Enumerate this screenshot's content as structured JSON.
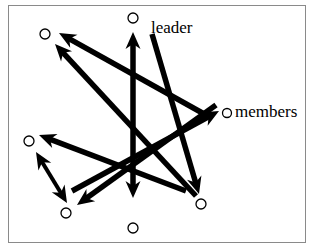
{
  "figure": {
    "type": "diagram",
    "kind": "node-link-graph",
    "background": "#ffffff",
    "frame": {
      "border_color": "#8a8a8a",
      "border_width": 1,
      "x": 8,
      "y": 5,
      "width": 298,
      "height": 238
    },
    "stroke_color": "#000000",
    "node_style": {
      "shape": "circle",
      "fill": "none",
      "stroke": "#000000",
      "stroke_width": 1.3,
      "radius": 5
    }
  },
  "labels": {
    "leader": "leader",
    "members": "members"
  },
  "nodes": [
    {
      "id": "n-top-center",
      "role": "leader",
      "cx": 133,
      "cy": 18,
      "r": 5
    },
    {
      "id": "n-top-left",
      "role": "member",
      "cx": 45,
      "cy": 34,
      "r": 5
    },
    {
      "id": "n-members",
      "role": "members-legend",
      "cx": 227,
      "cy": 113,
      "r": 4.5
    },
    {
      "id": "n-left",
      "role": "member",
      "cx": 29,
      "cy": 141,
      "r": 5
    },
    {
      "id": "n-bottom-left",
      "role": "member",
      "cx": 66,
      "cy": 213,
      "r": 5
    },
    {
      "id": "n-bottom-center",
      "role": "member",
      "cx": 133,
      "cy": 228,
      "r": 5
    },
    {
      "id": "n-bottom-right",
      "role": "member",
      "cx": 201,
      "cy": 204,
      "r": 5
    }
  ],
  "edges": [
    {
      "id": "e-vertical",
      "from": [
        133,
        198
      ],
      "to": [
        133,
        32
      ],
      "heads": "both",
      "width": 5.5
    },
    {
      "id": "e-bottomright-to-topleft",
      "from": [
        196,
        196
      ],
      "to": [
        55,
        44
      ],
      "heads": "end",
      "width": 5.5
    },
    {
      "id": "e-right-to-topleft",
      "from": [
        206,
        115
      ],
      "to": [
        59,
        33
      ],
      "heads": "end",
      "width": 5.5
    },
    {
      "id": "e-leader-to-bottomright",
      "from": [
        152,
        34
      ],
      "to": [
        199,
        194
      ],
      "heads": "end",
      "width": 5.5
    },
    {
      "id": "e-members-to-bottomleft",
      "from": [
        216,
        105
      ],
      "to": [
        77,
        205
      ],
      "heads": "end",
      "width": 5.5
    },
    {
      "id": "e-bottomleft-to-members",
      "from": [
        72,
        191
      ],
      "to": [
        219,
        111
      ],
      "heads": "end",
      "width": 5.5
    },
    {
      "id": "e-left-bottomleft",
      "from": [
        36,
        152
      ],
      "to": [
        67,
        203
      ],
      "heads": "both",
      "width": 4.0
    },
    {
      "id": "e-right-to-left",
      "from": [
        186,
        191
      ],
      "to": [
        39,
        135
      ],
      "heads": "end",
      "width": 5.5
    }
  ],
  "arrowhead": {
    "length": 17,
    "half_width": 7.5,
    "style": "solid-triangle-barbed"
  },
  "colors": {
    "stroke": "#000000",
    "frame": "#8a8a8a",
    "background": "#ffffff",
    "text": "#000000"
  }
}
